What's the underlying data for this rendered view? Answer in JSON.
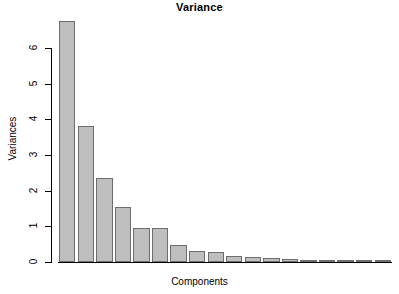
{
  "chart_data": {
    "type": "bar",
    "title": "Variance",
    "xlabel": "Components",
    "ylabel": "Variances",
    "categories": [
      "1",
      "2",
      "3",
      "4",
      "5",
      "6",
      "7",
      "8",
      "9",
      "10",
      "11",
      "12",
      "13",
      "14",
      "15",
      "16",
      "17",
      "18"
    ],
    "values": [
      6.75,
      3.81,
      2.35,
      1.54,
      0.95,
      0.94,
      0.48,
      0.31,
      0.28,
      0.17,
      0.14,
      0.1,
      0.09,
      0.05,
      0.04,
      0.03,
      0.02,
      0.01
    ],
    "ylim": [
      0,
      6.95
    ],
    "yticks": [
      0,
      1,
      2,
      3,
      4,
      5,
      6
    ],
    "ytick_labels": [
      "0",
      "1",
      "2",
      "3",
      "4",
      "5",
      "6"
    ],
    "xticks": [],
    "grid": false,
    "legend": null,
    "bar_fill": "#bebebe",
    "bar_border": "#6e6e6e",
    "background": "#ffffff",
    "axis_color": "#000000"
  }
}
